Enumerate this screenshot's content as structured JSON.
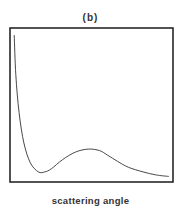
{
  "chart_data": {
    "type": "line",
    "title": "(b)",
    "xlabel": "scattering angle",
    "ylabel": "",
    "grid": false,
    "legend": null,
    "axes_ticks": false,
    "series": [
      {
        "name": "intensity",
        "x_norm": [
          0.02,
          0.03,
          0.05,
          0.08,
          0.12,
          0.17,
          0.21,
          0.25,
          0.32,
          0.4,
          0.48,
          0.55,
          0.6,
          0.66,
          0.73,
          0.82,
          0.9,
          0.98
        ],
        "y_norm": [
          0.96,
          0.7,
          0.45,
          0.25,
          0.12,
          0.06,
          0.06,
          0.08,
          0.14,
          0.19,
          0.21,
          0.2,
          0.17,
          0.13,
          0.09,
          0.06,
          0.04,
          0.03
        ]
      }
    ]
  },
  "colors": {
    "frame": "#1a1a1a",
    "curve": "#333333",
    "text": "#333333"
  }
}
